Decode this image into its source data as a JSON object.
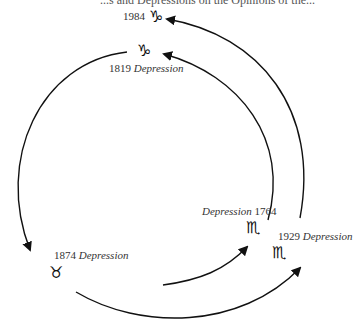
{
  "header": {
    "partial_text": "...s and Depressions on the Opinions of the..."
  },
  "nodes": [
    {
      "id": "1984",
      "year": "1984",
      "label": "",
      "sign": "♑",
      "sign_name": "capricorn"
    },
    {
      "id": "1819",
      "year": "1819",
      "label": "Depression",
      "sign": "♑",
      "sign_name": "capricorn"
    },
    {
      "id": "1874",
      "year": "1874",
      "label": "Depression",
      "sign": "♉",
      "sign_name": "taurus"
    },
    {
      "id": "1764",
      "year": "1764",
      "label": "Depression",
      "sign": "♏",
      "sign_name": "scorpio"
    },
    {
      "id": "1929",
      "year": "1929",
      "label": "Depression",
      "sign": "♏",
      "sign_name": "scorpio"
    }
  ],
  "edges": [
    {
      "from": "1819",
      "to": "1874"
    },
    {
      "from": "1874",
      "to": "1764"
    },
    {
      "from": "1874",
      "to": "1929"
    },
    {
      "from": "1764",
      "to": "1819"
    },
    {
      "from": "1929",
      "to": "1984"
    }
  ],
  "colors": {
    "line": "#111111",
    "text": "#333333",
    "background": "#ffffff"
  }
}
